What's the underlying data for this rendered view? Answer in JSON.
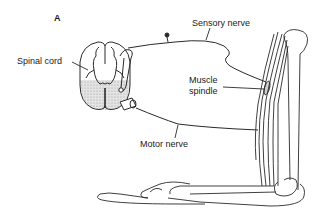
{
  "figure": {
    "panel_label": "A",
    "labels": {
      "spinal_cord": "Spinal cord",
      "sensory_nerve": "Sensory nerve",
      "muscle_spindle_line1": "Muscle",
      "muscle_spindle_line2": "spindle",
      "motor_nerve": "Motor nerve"
    },
    "colors": {
      "line": "#2a2a2a",
      "gray_matter_hatch": "#cfcfcf",
      "background": "#ffffff"
    }
  }
}
